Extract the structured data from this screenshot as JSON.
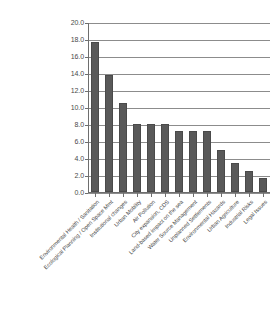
{
  "chart_data": {
    "type": "bar",
    "title": "",
    "subtitle": "",
    "xlabel": "",
    "ylabel": "",
    "ylim": [
      0.0,
      20.0
    ],
    "ytick_labels": [
      "20.0",
      "18.0",
      "16.0",
      "14.0",
      "12.0",
      "10.0",
      "8.0",
      "6.0",
      "4.0",
      "2.0",
      "0.0"
    ],
    "ytick_values": [
      20.0,
      18.0,
      16.0,
      14.0,
      12.0,
      10.0,
      8.0,
      6.0,
      4.0,
      2.0,
      0.0
    ],
    "grid": true,
    "grid_axis": "y",
    "legend": false,
    "legend_position": "none",
    "bar_color": "#595959",
    "bar_edge_color": "#4a4a4a",
    "grid_color": "#8c8c8c",
    "axis_color": "#6e6e6e",
    "background_color": "#ffffff",
    "categories": [
      "Environmental Health / Sanitation",
      "Ecological Planning / Open Space Mmt",
      "Institutional changes",
      "Urban Mobility",
      "Air Pollution",
      "City expansion, CDS",
      "Land-based impact on the sea",
      "Water Source Management",
      "Unplanned Settlements",
      "Environmental Hazards",
      "Urban Agriculture",
      "Industrial Risks",
      "Legal Issues"
    ],
    "values": [
      17.7,
      13.8,
      10.5,
      8.0,
      8.0,
      8.0,
      7.2,
      7.2,
      7.2,
      4.9,
      3.4,
      2.5,
      1.7
    ]
  }
}
